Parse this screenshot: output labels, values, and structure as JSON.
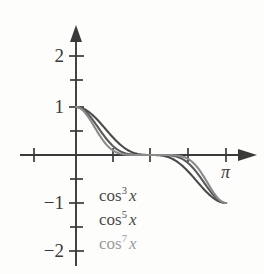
{
  "figure": {
    "background_color": "#fdfdfc",
    "axis_color": "#3a3a3a"
  },
  "axes": {
    "x_label": "π",
    "y_tick_labels": [
      "2",
      "1",
      "−1",
      "−2"
    ],
    "x_tick_label_pi": "π"
  },
  "legend": {
    "entries": [
      {
        "base": "cos",
        "power": "3",
        "variable": "x",
        "color": "#4a4a4a"
      },
      {
        "base": "cos",
        "power": "5",
        "variable": "x",
        "color": "#4a4a4a"
      },
      {
        "base": "cos",
        "power": "7",
        "variable": "x",
        "color": "#9a9a9a"
      }
    ]
  },
  "chart_data": {
    "type": "line",
    "title": "",
    "xlabel": "",
    "ylabel": "",
    "xlim": [
      -1.1,
      3.65
    ],
    "ylim": [
      -2.3,
      2.3
    ],
    "grid": false,
    "legend_position": "inside-lower-left",
    "x_ticks": [
      -1.1,
      0,
      0.785,
      1.571,
      2.356,
      3.1416
    ],
    "x_tick_labels": [
      "",
      "",
      "",
      "",
      "",
      "π"
    ],
    "y_ticks": [
      -2,
      -1.5,
      -1,
      -0.5,
      0,
      0.5,
      1,
      1.5,
      2
    ],
    "y_tick_labels": [
      "−2",
      "",
      "−1",
      "",
      "",
      "",
      "1",
      "",
      "2"
    ],
    "series": [
      {
        "name": "cos^3 x",
        "label": "cos³x",
        "color": "#4a4a4a",
        "exponent": 3,
        "x": [
          0,
          0.1571,
          0.3142,
          0.4712,
          0.6283,
          0.7854,
          0.9425,
          1.0996,
          1.2566,
          1.4137,
          1.5708,
          1.7279,
          1.885,
          2.042,
          2.1991,
          2.3562,
          2.5133,
          2.6704,
          2.8274,
          2.9845,
          3.1416
        ],
        "y": [
          1.0,
          0.9546,
          0.8253,
          0.6348,
          0.4161,
          0.2071,
          0.0603,
          0.0037,
          0.0,
          -0.0037,
          -0.0603,
          -0.2071,
          -0.4161,
          -0.6348,
          -0.8253,
          -0.9546,
          -1.0,
          -0.9546,
          -0.8253,
          -0.6348,
          -1.0
        ]
      },
      {
        "name": "cos^5 x",
        "label": "cos⁵x",
        "color": "#5a5a5a",
        "exponent": 5,
        "x": [
          0,
          0.1571,
          0.3142,
          0.4712,
          0.6283,
          0.7854,
          0.9425,
          1.0996,
          1.2566,
          1.4137,
          1.5708,
          1.7279,
          1.885,
          2.042,
          2.1991,
          2.3562,
          2.5133,
          2.6704,
          2.8274,
          2.9845,
          3.1416
        ],
        "y": [
          1.0,
          0.933,
          0.7557,
          0.5109,
          0.273,
          0.1036,
          0.0175,
          0.0002,
          0.0,
          -0.0002,
          -0.0175,
          -0.1036,
          -0.273,
          -0.5109,
          -0.7557,
          -0.933,
          -1.0,
          -0.933,
          -0.7557,
          -0.5109,
          -1.0
        ]
      },
      {
        "name": "cos^7 x",
        "label": "cos⁷x",
        "color": "#8a8a8a",
        "exponent": 7,
        "x": [
          0,
          0.1571,
          0.3142,
          0.4712,
          0.6283,
          0.7854,
          0.9425,
          1.0996,
          1.2566,
          1.4137,
          1.5708,
          1.7279,
          1.885,
          2.042,
          2.1991,
          2.3562,
          2.5133,
          2.6704,
          2.8274,
          2.9845,
          3.1416
        ],
        "y": [
          1.0,
          0.9118,
          0.6919,
          0.4113,
          0.1791,
          0.0518,
          0.0051,
          0.0,
          0.0,
          0.0,
          -0.0051,
          -0.0518,
          -0.1791,
          -0.4113,
          -0.6919,
          -0.9118,
          -1.0,
          -0.9118,
          -0.6919,
          -0.4113,
          -1.0
        ]
      }
    ]
  },
  "geometry": {
    "origin_x": 76,
    "origin_y": 155,
    "unit_x": 47.8,
    "unit_y": 48
  }
}
